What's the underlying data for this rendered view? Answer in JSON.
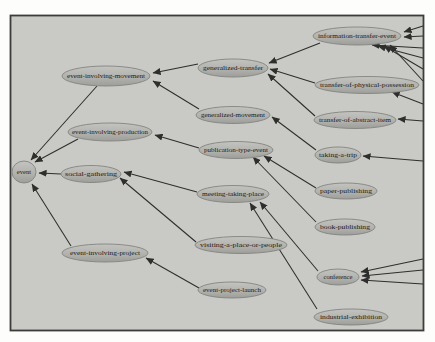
{
  "diagram": {
    "colors": {
      "canvas_background": "#c9c9c5",
      "frame_border": "#3c3c3a",
      "node_fill": "#b2b2ae",
      "node_stroke": "#83837f",
      "edge_color": "#2e2e2c",
      "label_text": "#1c1c1a",
      "page_margin": "#fdfdfc"
    },
    "nodes": [
      {
        "id": "event",
        "label": "event"
      },
      {
        "id": "event-involving-movement",
        "label": "event-involving-movement"
      },
      {
        "id": "event-involving-production",
        "label": "event-involving-production"
      },
      {
        "id": "social-gathering",
        "label": "social-gathering"
      },
      {
        "id": "event-involving-project",
        "label": "event-involving-project"
      },
      {
        "id": "generalized-transfer",
        "label": "generalized-transfer"
      },
      {
        "id": "generalized-movement",
        "label": "generalized-movement"
      },
      {
        "id": "publication-type-event",
        "label": "publication-type-event"
      },
      {
        "id": "meeting-taking-place",
        "label": "meeting-taking-place"
      },
      {
        "id": "visiting-a-place-or-people",
        "label": "visiting-a-place-or-people"
      },
      {
        "id": "event-project-launch",
        "label": "event-project-launch"
      },
      {
        "id": "information-transfer-event",
        "label": "information-transfer-event"
      },
      {
        "id": "transfer-of-physical-possession",
        "label": "transfer-of-physical-possession"
      },
      {
        "id": "transfer-of-abstract-item",
        "label": "transfer-of-abstract-item"
      },
      {
        "id": "taking-a-trip",
        "label": "taking-a-trip"
      },
      {
        "id": "paper-publishing",
        "label": "paper-publishing"
      },
      {
        "id": "book-publishing",
        "label": "book-publishing"
      },
      {
        "id": "conference",
        "label": "conference"
      },
      {
        "id": "industrial-exhibition",
        "label": "industrial-exhibition"
      }
    ],
    "edges": [
      {
        "from": "event-involving-movement",
        "to": "event"
      },
      {
        "from": "event-involving-production",
        "to": "event"
      },
      {
        "from": "social-gathering",
        "to": "event"
      },
      {
        "from": "event-involving-project",
        "to": "event"
      },
      {
        "from": "generalized-transfer",
        "to": "event-involving-movement"
      },
      {
        "from": "generalized-movement",
        "to": "event-involving-movement"
      },
      {
        "from": "information-transfer-event",
        "to": "generalized-transfer"
      },
      {
        "from": "transfer-of-physical-possession",
        "to": "generalized-transfer"
      },
      {
        "from": "transfer-of-abstract-item",
        "to": "generalized-transfer"
      },
      {
        "from": "taking-a-trip",
        "to": "generalized-movement"
      },
      {
        "from": "publication-type-event",
        "to": "event-involving-production"
      },
      {
        "from": "paper-publishing",
        "to": "publication-type-event"
      },
      {
        "from": "book-publishing",
        "to": "publication-type-event"
      },
      {
        "from": "meeting-taking-place",
        "to": "social-gathering"
      },
      {
        "from": "visiting-a-place-or-people",
        "to": "social-gathering"
      },
      {
        "from": "conference",
        "to": "meeting-taking-place"
      },
      {
        "from": "industrial-exhibition",
        "to": "meeting-taking-place"
      },
      {
        "from": "event-project-launch",
        "to": "event-involving-project"
      },
      {
        "from": "offscreen-right",
        "to": "information-transfer-event"
      },
      {
        "from": "offscreen-right",
        "to": "information-transfer-event"
      },
      {
        "from": "offscreen-right",
        "to": "information-transfer-event"
      },
      {
        "from": "offscreen-right",
        "to": "information-transfer-event"
      },
      {
        "from": "offscreen-right",
        "to": "information-transfer-event"
      },
      {
        "from": "offscreen-right",
        "to": "information-transfer-event"
      },
      {
        "from": "offscreen-right",
        "to": "transfer-of-physical-possession"
      },
      {
        "from": "offscreen-right",
        "to": "transfer-of-abstract-item"
      },
      {
        "from": "offscreen-right",
        "to": "taking-a-trip"
      },
      {
        "from": "offscreen-right",
        "to": "conference"
      },
      {
        "from": "offscreen-right",
        "to": "conference"
      },
      {
        "from": "offscreen-right",
        "to": "conference"
      }
    ]
  }
}
